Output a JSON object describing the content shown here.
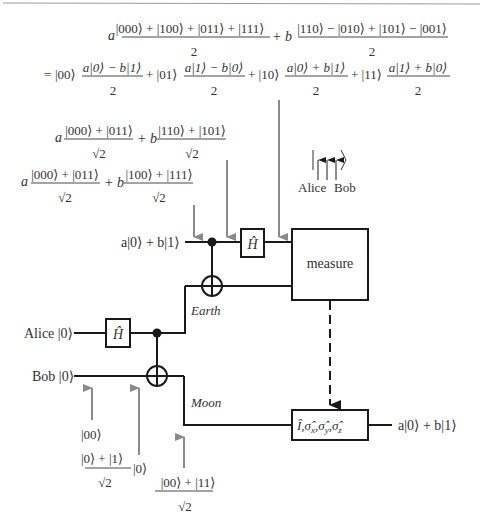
{
  "figure": {
    "colors": {
      "wire": "#1a1a1a",
      "arrow_gray": "#8a8a8a",
      "text": "#333333",
      "rule": "#9a9a9a"
    }
  },
  "equations": {
    "top_line1": {
      "a_coef": "a",
      "a_num": "|000⟩ + |100⟩ + |011⟩ + |111⟩",
      "a_den": "2",
      "plus_b": "+ b",
      "b_num": "|110⟩ − |010⟩ + |101⟩ − |001⟩",
      "b_den": "2"
    },
    "top_line2": {
      "eq": "=",
      "terms": [
        {
          "ket": "|00⟩",
          "num": "a|0⟩ − b|1⟩",
          "den": "2"
        },
        {
          "ket": "+ |01⟩",
          "num": "a|1⟩ − b|0⟩",
          "den": "2"
        },
        {
          "ket": "+ |10⟩",
          "num": "a|0⟩ + b|1⟩",
          "den": "2"
        },
        {
          "ket": "+ |11⟩",
          "num": "a|1⟩ + b|0⟩",
          "den": "2"
        }
      ]
    },
    "after_cnot_h": {
      "a_coef": "a",
      "a_num": "|000⟩ + |011⟩",
      "a_den": "√2",
      "plus_b": "+ b",
      "b_num": "|110⟩ + |101⟩",
      "b_den": "√2"
    },
    "after_entangle": {
      "a_coef": "a",
      "a_num": "|000⟩ + |011⟩",
      "a_den": "√2",
      "plus_b": "+ b",
      "b_num": "|100⟩ + |111⟩",
      "b_den": "√2"
    },
    "bottom": {
      "initial": "|00⟩",
      "after_h_num": "|0⟩ + |1⟩",
      "after_h_den": "√2",
      "after_h_ket": "|0⟩",
      "bell_num": "|00⟩ + |11⟩",
      "bell_den": "√2"
    }
  },
  "legend": {
    "ket_open": "|",
    "ket_close": "⟩",
    "alice": "Alice",
    "bob": "Bob"
  },
  "circuit": {
    "input_state": "a|0⟩ + b|1⟩",
    "alice_label": "Alice |0⟩",
    "bob_label": "Bob |0⟩",
    "earth_label": "Earth",
    "moon_label": "Moon",
    "hadamard": "Ĥ",
    "measure_label": "measure",
    "correction_label": "Î, σ̂x, σ̂y, σ̂z",
    "correction_parts": [
      "Î,",
      "σ̂",
      "x",
      ",",
      "σ̂",
      "y",
      ",",
      "σ̂",
      "z"
    ],
    "output_state": "a|0⟩ + b|1⟩"
  }
}
